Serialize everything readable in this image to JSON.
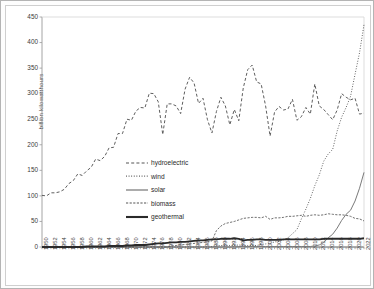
{
  "chart_data": {
    "type": "line",
    "title": "",
    "xlabel": "",
    "ylabel": "billion kilowatthours",
    "ylim": [
      0,
      450
    ],
    "ytick_step": 50,
    "yticks": [
      "0",
      "50",
      "100",
      "150",
      "200",
      "250",
      "300",
      "350",
      "400",
      "450"
    ],
    "grid": false,
    "legend_position": "center-left",
    "x": [
      1950,
      1951,
      1952,
      1953,
      1954,
      1955,
      1956,
      1957,
      1958,
      1959,
      1960,
      1961,
      1962,
      1963,
      1964,
      1965,
      1966,
      1967,
      1968,
      1969,
      1970,
      1971,
      1972,
      1973,
      1974,
      1975,
      1976,
      1977,
      1978,
      1979,
      1980,
      1981,
      1982,
      1983,
      1984,
      1985,
      1986,
      1987,
      1988,
      1989,
      1990,
      1991,
      1992,
      1993,
      1994,
      1995,
      1996,
      1997,
      1998,
      1999,
      2000,
      2001,
      2002,
      2003,
      2004,
      2005,
      2006,
      2007,
      2008,
      2009,
      2010,
      2011,
      2012,
      2013,
      2014,
      2015,
      2016,
      2017,
      2018,
      2019,
      2020,
      2021,
      2022
    ],
    "xtick_labels": [
      "1950",
      "1952",
      "1954",
      "1956",
      "1958",
      "1960",
      "1962",
      "1964",
      "1966",
      "1968",
      "1970",
      "1972",
      "1974",
      "1976",
      "1978",
      "1980",
      "1982",
      "1984",
      "1986",
      "1988",
      "1990",
      "1992",
      "1994",
      "1996",
      "1998",
      "2000",
      "2002",
      "2004",
      "2006",
      "2008",
      "2010",
      "2012",
      "2014",
      "2016",
      "2018",
      "2020",
      "2022"
    ],
    "series": [
      {
        "name": "hydroelectric",
        "style": "dashed",
        "color": "#555555",
        "values": [
          101,
          100,
          106,
          106,
          108,
          113,
          124,
          130,
          143,
          140,
          149,
          156,
          172,
          169,
          177,
          194,
          195,
          222,
          222,
          250,
          248,
          266,
          273,
          272,
          301,
          300,
          284,
          220,
          280,
          280,
          276,
          261,
          309,
          332,
          321,
          281,
          291,
          249,
          223,
          265,
          293,
          276,
          239,
          269,
          247,
          311,
          347,
          356,
          323,
          319,
          276,
          217,
          264,
          275,
          268,
          270,
          289,
          248,
          255,
          273,
          260,
          319,
          276,
          269,
          259,
          249,
          268,
          300,
          293,
          288,
          291,
          260,
          262
        ]
      },
      {
        "name": "wind",
        "style": "dotted",
        "color": "#555555",
        "values": [
          0,
          0,
          0,
          0,
          0,
          0,
          0,
          0,
          0,
          0,
          0,
          0,
          0,
          0,
          0,
          0,
          0,
          0,
          0,
          0,
          0,
          0,
          0,
          0,
          0,
          0,
          0,
          0,
          0,
          0,
          0,
          0,
          0,
          0,
          0,
          0,
          0,
          0,
          1,
          2,
          3,
          3,
          3,
          3,
          4,
          3,
          3,
          3,
          3,
          5,
          6,
          7,
          10,
          11,
          14,
          18,
          26,
          34,
          55,
          74,
          95,
          120,
          141,
          168,
          182,
          191,
          227,
          254,
          273,
          295,
          338,
          380,
          435
        ]
      },
      {
        "name": "solar",
        "style": "solid-thin",
        "color": "#7a7a7a",
        "values": [
          0,
          0,
          0,
          0,
          0,
          0,
          0,
          0,
          0,
          0,
          0,
          0,
          0,
          0,
          0,
          0,
          0,
          0,
          0,
          0,
          0,
          0,
          0,
          0,
          0,
          0,
          0,
          0,
          0,
          0,
          0,
          0,
          0,
          0,
          0,
          0,
          0,
          0,
          0,
          0,
          0,
          0,
          0,
          0,
          1,
          1,
          1,
          1,
          1,
          1,
          1,
          1,
          1,
          1,
          1,
          1,
          1,
          1,
          1,
          1,
          1,
          2,
          4,
          9,
          18,
          25,
          37,
          52,
          64,
          72,
          90,
          115,
          146
        ]
      },
      {
        "name": "biomass",
        "style": "short-dash",
        "color": "#555555",
        "values": [
          0,
          0,
          0,
          0,
          0,
          0,
          0,
          0,
          0,
          0,
          0,
          0,
          0,
          0,
          0,
          0,
          0,
          0,
          0,
          0,
          0,
          0,
          0,
          0,
          0,
          0,
          0,
          0,
          0,
          2,
          3,
          4,
          5,
          6,
          7,
          8,
          9,
          10,
          12,
          32,
          41,
          46,
          48,
          50,
          53,
          56,
          57,
          58,
          58,
          57,
          60,
          54,
          57,
          57,
          58,
          60,
          60,
          61,
          62,
          60,
          62,
          63,
          62,
          63,
          65,
          64,
          63,
          63,
          62,
          60,
          56,
          55,
          51
        ]
      },
      {
        "name": "geothermal",
        "style": "solid-thick",
        "color": "#2a2a2a",
        "values": [
          0,
          0,
          0,
          0,
          0,
          0,
          0,
          0,
          0,
          0,
          1,
          1,
          1,
          1,
          1,
          2,
          2,
          2,
          2,
          3,
          3,
          4,
          4,
          4,
          5,
          6,
          7,
          7,
          8,
          9,
          9,
          10,
          10,
          11,
          12,
          13,
          13,
          14,
          15,
          15,
          16,
          16,
          16,
          17,
          16,
          13,
          14,
          14,
          15,
          15,
          14,
          14,
          14,
          14,
          15,
          15,
          15,
          15,
          15,
          15,
          15,
          15,
          15,
          16,
          16,
          16,
          16,
          16,
          16,
          16,
          16,
          16,
          17
        ]
      }
    ]
  },
  "legend": {
    "items": [
      {
        "label": "hydroelectric"
      },
      {
        "label": "wind"
      },
      {
        "label": "solar"
      },
      {
        "label": "biomass"
      },
      {
        "label": "geothermal"
      }
    ]
  }
}
